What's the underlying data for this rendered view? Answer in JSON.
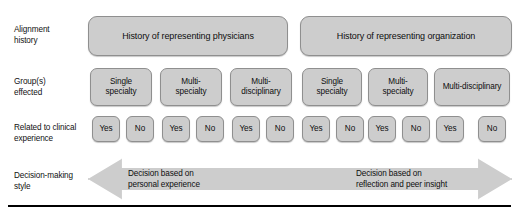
{
  "figure": {
    "colors": {
      "box_fill": "#cdcdcd",
      "box_border": "#8f8f8f",
      "text": "#0d0d0d",
      "rule": "#000000",
      "background": "#ffffff"
    }
  },
  "rows": {
    "alignment": {
      "label": "Alignment\nhistory"
    },
    "groups": {
      "label": "Group(s)\neffected"
    },
    "related": {
      "label": "Related to clinical\nexperience"
    },
    "decision": {
      "label": "Decision-making\nstyle"
    }
  },
  "history_boxes": [
    {
      "label": "History of representing physicians",
      "left": 88,
      "width": 200
    },
    {
      "label": "History of representing organization",
      "left": 300,
      "width": 212
    }
  ],
  "group_boxes": [
    {
      "label": "Single\nspecialty",
      "left": 90,
      "width": 62
    },
    {
      "label": "Multi-\nspecialty",
      "left": 160,
      "width": 62
    },
    {
      "label": "Multi-\ndisciplinary",
      "left": 230,
      "width": 62
    },
    {
      "label": "Single\nspecialty",
      "left": 302,
      "width": 60
    },
    {
      "label": "Multi-\nspecialty",
      "left": 368,
      "width": 60
    },
    {
      "label": "Multi-disciplinary",
      "left": 434,
      "width": 76
    }
  ],
  "yesno_boxes": [
    {
      "label": "Yes",
      "left": 92
    },
    {
      "label": "No",
      "left": 126
    },
    {
      "label": "Yes",
      "left": 162
    },
    {
      "label": "No",
      "left": 196
    },
    {
      "label": "Yes",
      "left": 232
    },
    {
      "label": "No",
      "left": 266
    },
    {
      "label": "Yes",
      "left": 302
    },
    {
      "label": "No",
      "left": 336
    },
    {
      "label": "Yes",
      "left": 368
    },
    {
      "label": "No",
      "left": 402
    },
    {
      "label": "Yes",
      "left": 436
    },
    {
      "label": "No",
      "left": 478
    }
  ],
  "arrow": {
    "left_text": "Decision based on\npersonal experience",
    "right_text": "Decision based on\nreflection and peer insight",
    "direction": "double-headed"
  }
}
